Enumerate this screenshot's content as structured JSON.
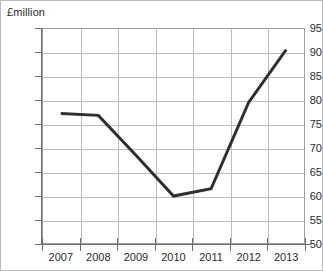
{
  "chart_data": {
    "type": "line",
    "title": "",
    "subtitle": "",
    "xlabel": "",
    "ylabel": "£million",
    "categories": [
      "2007",
      "2008",
      "2009",
      "2010",
      "2011",
      "2012",
      "2013"
    ],
    "x": [
      2007,
      2008,
      2009,
      2010,
      2011,
      2012,
      2013
    ],
    "values": [
      77.2,
      76.8,
      68.5,
      60.0,
      61.5,
      79.5,
      90.5
    ],
    "series": [
      {
        "name": "",
        "values": [
          77.2,
          76.8,
          68.5,
          60.0,
          61.5,
          79.5,
          90.5
        ]
      }
    ],
    "ylim": [
      50,
      95
    ],
    "ytick_values": [
      50,
      55,
      60,
      65,
      70,
      75,
      80,
      85,
      90,
      95
    ],
    "ytick_labels": [
      "50",
      "55",
      "60",
      "65",
      "70",
      "75",
      "80",
      "85",
      "90",
      "95"
    ],
    "ytick_step": 5,
    "xtick_labels": [
      "2007",
      "2008",
      "2009",
      "2010",
      "2011",
      "2012",
      "2013"
    ],
    "grid": true,
    "grid_axis": "both",
    "legend": false,
    "legend_position": "none",
    "annotations": []
  },
  "figure": {
    "axis_unit_label": "£million",
    "line_color": "#2f2f2f",
    "grid_color": "#bdbdbd",
    "axis_color": "#6e6e6e",
    "border_color": "#b9b9b9",
    "background_color": "#ffffff",
    "text_color": "#2b2b2b"
  }
}
